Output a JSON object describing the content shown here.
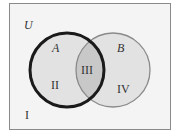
{
  "diagram": {
    "type": "venn",
    "universe_label": "U",
    "sets": [
      {
        "name": "A",
        "style": "bold outline"
      },
      {
        "name": "B",
        "style": "thin outline"
      }
    ],
    "regions": {
      "outside": "I",
      "a_only": "II",
      "intersection": "III",
      "b_only": "IV"
    },
    "colors": {
      "background": "#f4f4f4",
      "frame": "#8a8a8a",
      "set_fill": "#e2e2e2",
      "intersection_fill": "#c8c8c8",
      "circle_a_stroke": "#1a1a1a",
      "circle_b_stroke": "#8a8a8a"
    }
  }
}
